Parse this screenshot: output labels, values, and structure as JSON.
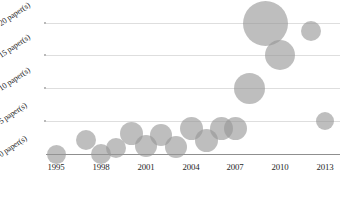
{
  "chart": {
    "type": "bubble",
    "title": "",
    "xlabel": "",
    "ylabel": ""
  },
  "y_axis": {
    "ticks": [
      {
        "value": 20,
        "label": "20 paper(s)",
        "px": 23
      },
      {
        "value": 15,
        "label": "15 paper(s)",
        "px": 55
      },
      {
        "value": 10,
        "label": "10 paper(s)",
        "px": 88
      },
      {
        "value": 5,
        "label": "5 paper(s)",
        "px": 121
      },
      {
        "value": 0,
        "label": "0 paper(s)",
        "px": 154
      }
    ],
    "range": [
      0,
      20
    ],
    "grid": true
  },
  "x_axis": {
    "ticks": [
      {
        "value": 1995,
        "label": "1995",
        "px": 56
      },
      {
        "value": 1998,
        "label": "1998",
        "px": 101
      },
      {
        "value": 2001,
        "label": "2001",
        "px": 146
      },
      {
        "value": 2004,
        "label": "2004",
        "px": 191
      },
      {
        "value": 2007,
        "label": "2007",
        "px": 235
      },
      {
        "value": 2010,
        "label": "2010",
        "px": 280
      },
      {
        "value": 2013,
        "label": "2013",
        "px": 325
      }
    ],
    "range": [
      1994,
      2013.5
    ]
  },
  "colors": {
    "bubble_fill": "#969696",
    "gridline": "#dedede",
    "axis": "#8f8f8f",
    "text": "#1f1f1f",
    "background": "#ffffff"
  },
  "chart_data": {
    "type": "scatter",
    "title": "",
    "xlabel": "",
    "ylabel": "paper(s)",
    "xlim": [
      1994,
      2013.5
    ],
    "ylim": [
      0,
      20
    ],
    "grid": true,
    "legend": "none",
    "x_tick_labels": [
      "1995",
      "1998",
      "2001",
      "2004",
      "2007",
      "2010",
      "2013"
    ],
    "y_tick_labels": [
      "0 paper(s)",
      "5 paper(s)",
      "10 paper(s)",
      "15 paper(s)",
      "20 paper(s)"
    ],
    "note": "Bubble chart: x = year, y = number of papers, bubble size also encodes number of papers",
    "points": [
      {
        "x": 1995,
        "y": 0,
        "size": 12,
        "cx": 56,
        "cy": 154,
        "r": 9.5
      },
      {
        "x": 1997,
        "y": 2,
        "size": 13,
        "cx": 86,
        "cy": 140,
        "r": 10.0
      },
      {
        "x": 1998,
        "y": 0,
        "size": 13,
        "cx": 101,
        "cy": 154,
        "r": 10.0
      },
      {
        "x": 1999,
        "y": 1,
        "size": 13,
        "cx": 116,
        "cy": 148,
        "r": 10.0
      },
      {
        "x": 2000,
        "y": 3,
        "size": 15,
        "cx": 131,
        "cy": 133,
        "r": 11.5
      },
      {
        "x": 2001,
        "y": 1,
        "size": 14,
        "cx": 146,
        "cy": 146,
        "r": 11.0
      },
      {
        "x": 2002,
        "y": 3,
        "size": 14,
        "cx": 161,
        "cy": 135,
        "r": 11.0
      },
      {
        "x": 2003,
        "y": 1,
        "size": 14,
        "cx": 176,
        "cy": 147,
        "r": 11.0
      },
      {
        "x": 2004,
        "y": 4,
        "size": 15,
        "cx": 191,
        "cy": 128,
        "r": 11.5
      },
      {
        "x": 2005,
        "y": 2,
        "size": 15,
        "cx": 206,
        "cy": 140,
        "r": 11.5
      },
      {
        "x": 2006,
        "y": 4,
        "size": 15,
        "cx": 221,
        "cy": 128,
        "r": 11.5
      },
      {
        "x": 2007,
        "y": 4,
        "size": 15,
        "cx": 235,
        "cy": 128,
        "r": 11.5
      },
      {
        "x": 2008,
        "y": 10,
        "size": 20,
        "cx": 249,
        "cy": 88,
        "r": 15.5
      },
      {
        "x": 2009,
        "y": 20,
        "size": 29,
        "cx": 265,
        "cy": 23,
        "r": 22.5
      },
      {
        "x": 2010,
        "y": 15,
        "size": 19,
        "cx": 280,
        "cy": 55,
        "r": 15.0
      },
      {
        "x": 2012,
        "y": 19,
        "size": 13,
        "cx": 311,
        "cy": 31,
        "r": 10.0
      },
      {
        "x": 2013,
        "y": 5,
        "size": 12,
        "cx": 325,
        "cy": 121,
        "r": 9.0
      }
    ]
  }
}
